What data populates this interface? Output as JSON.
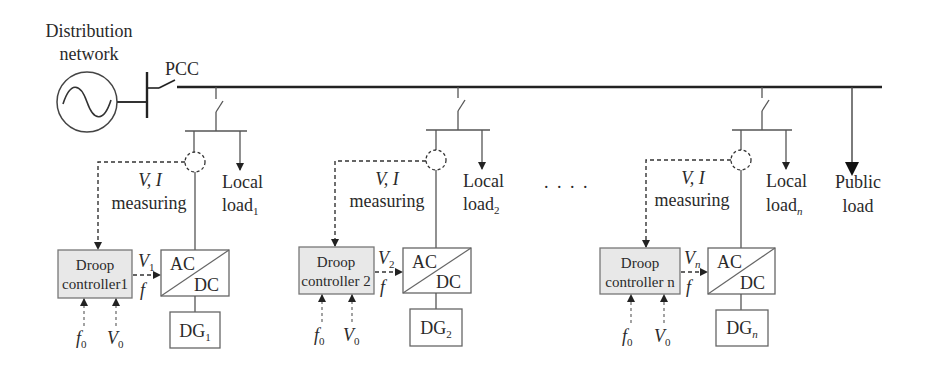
{
  "source": {
    "label_line1": "Distribution",
    "label_line2": "network",
    "icon": "ac-source-icon"
  },
  "pcc": {
    "label": "PCC"
  },
  "units": [
    {
      "measure_vars": "V, I",
      "measure_label": "measuring",
      "load_line1": "Local",
      "load_line2": "load",
      "load_sub": "1",
      "droop_line1": "Droop",
      "droop_line2": "controller1",
      "v_out": "V",
      "v_out_sub": "1",
      "f_out": "f",
      "conv_ac": "AC",
      "conv_dc": "DC",
      "dg": "DG",
      "dg_sub": "1",
      "f0": "f",
      "f0_sub": "0",
      "v0": "V",
      "v0_sub": "0"
    },
    {
      "measure_vars": "V, I",
      "measure_label": "measuring",
      "load_line1": "Local",
      "load_line2": "load",
      "load_sub": "2",
      "droop_line1": "Droop",
      "droop_line2": "controller 2",
      "v_out": "V",
      "v_out_sub": "2",
      "f_out": "f",
      "conv_ac": "AC",
      "conv_dc": "DC",
      "dg": "DG",
      "dg_sub": "2",
      "f0": "f",
      "f0_sub": "0",
      "v0": "V",
      "v0_sub": "0"
    },
    {
      "measure_vars": "V, I",
      "measure_label": "measuring",
      "load_line1": "Local",
      "load_line2": "load",
      "load_sub": "n",
      "droop_line1": "Droop",
      "droop_line2": "controller n",
      "v_out": "V",
      "v_out_sub": "n",
      "f_out": "f",
      "conv_ac": "AC",
      "conv_dc": "DC",
      "dg": "DG",
      "dg_sub": "n",
      "f0": "f",
      "f0_sub": "0",
      "v0": "V",
      "v0_sub": "0"
    }
  ],
  "ellipsis": ". . . .",
  "public_load": {
    "line1": "Public",
    "line2": "load"
  }
}
